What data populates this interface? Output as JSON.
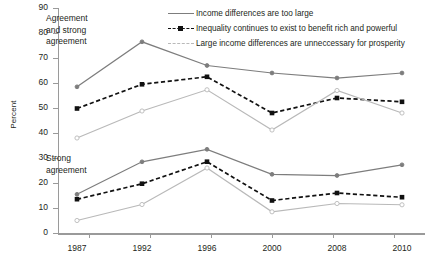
{
  "chart_data": {
    "type": "line",
    "title": "",
    "xlabel": "",
    "ylabel": "Percent",
    "categories": [
      "1987",
      "1992",
      "1996",
      "2000",
      "2008",
      "2010"
    ],
    "ylim": [
      0,
      90
    ],
    "yticks": [
      0,
      10,
      20,
      30,
      40,
      50,
      60,
      70,
      80,
      90
    ],
    "grid": false,
    "legend_position": "top-right",
    "groups": [
      {
        "name": "Agreement and strong agreement",
        "annotation": "Agreement\nand strong\nagreement",
        "series": [
          {
            "name": "Income differences are too large",
            "values": [
              58.5,
              76.5,
              67.0,
              64.0,
              62.0,
              64.0
            ]
          },
          {
            "name": "Inequality continues to exist to benefit rich and powerful",
            "values": [
              49.8,
              59.5,
              62.5,
              48.0,
              54.0,
              52.5
            ]
          },
          {
            "name": "Large income differences are unneccessary for prosperity",
            "values": [
              38.0,
              48.8,
              57.3,
              41.2,
              57.0,
              48.0
            ]
          }
        ]
      },
      {
        "name": "Strong agreement",
        "annotation": "Strong\nagreement",
        "series": [
          {
            "name": "Income differences are too large",
            "values": [
              15.5,
              28.5,
              33.5,
              23.5,
              23.0,
              27.3
            ]
          },
          {
            "name": "Inequality continues to exist to benefit rich and powerful",
            "values": [
              13.5,
              19.7,
              28.5,
              13.0,
              16.0,
              14.3
            ]
          },
          {
            "name": "Large income differences are unneccessary for prosperity",
            "values": [
              5.0,
              11.4,
              26.0,
              8.5,
              11.8,
              11.3
            ]
          }
        ]
      }
    ],
    "legend": [
      {
        "label": "Income differences are too large",
        "style": "solid",
        "color": "#7d7d7d"
      },
      {
        "label": "Inequality continues to exist to benefit rich and powerful",
        "style": "dashed",
        "color": "#111111"
      },
      {
        "label": "Large income differences are unneccessary for prosperity",
        "style": "light-dashed",
        "color": "#b9b9b9"
      }
    ],
    "colors": {
      "series_solid": "#7d7d7d",
      "series_dashed": "#111111",
      "series_light": "#b9b9b9",
      "axis": "#9a9a9a",
      "text": "#231f20",
      "background": "#ffffff"
    }
  }
}
